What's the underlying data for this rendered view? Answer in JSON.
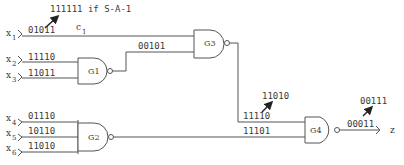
{
  "annotation_top": "111111 if S-A-1",
  "inputs": [
    {
      "name": "x",
      "sub": "1",
      "value": "01011"
    },
    {
      "name": "x",
      "sub": "2",
      "value": "11110"
    },
    {
      "name": "x",
      "sub": "3",
      "value": "11011"
    },
    {
      "name": "x",
      "sub": "4",
      "value": "01110"
    },
    {
      "name": "x",
      "sub": "5",
      "value": "10110"
    },
    {
      "name": "x",
      "sub": "6",
      "value": "11010"
    }
  ],
  "wire_c1": {
    "name": "c",
    "sub": "1"
  },
  "gates": {
    "g1": {
      "label": "G1",
      "output": "00101"
    },
    "g2": {
      "label": "G2",
      "output": "11101"
    },
    "g3": {
      "label": "G3",
      "output": "11110",
      "faulty_output": "11010"
    },
    "g4": {
      "label": "G4",
      "output": "00011",
      "faulty_output": "00111"
    }
  },
  "output": {
    "name": "z"
  }
}
